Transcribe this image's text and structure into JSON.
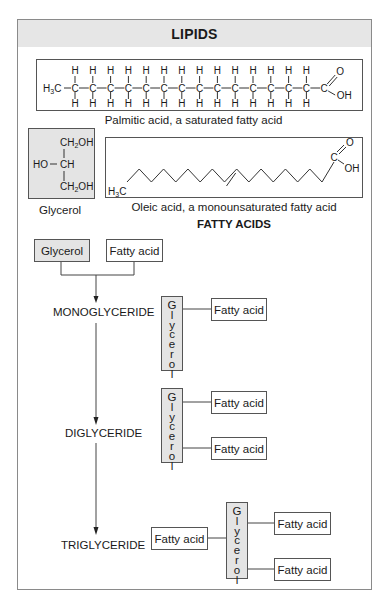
{
  "title": "LIPIDS",
  "fatty_acids_section": {
    "heading": "FATTY ACIDS",
    "palmitic": {
      "caption": "Palmitic acid, a saturated fatty acid",
      "methyl": "H3C",
      "ch2_count": 14,
      "atom_h": "H",
      "atom_c": "C",
      "carboxyl_o": "O",
      "carboxyl_oh": "OH"
    },
    "oleic": {
      "caption": "Oleic acid, a monounsaturated fatty acid",
      "methyl": "H3C",
      "carboxyl_c": "C",
      "carboxyl_o": "O",
      "carboxyl_oh": "OH"
    },
    "glycerol": {
      "caption": "Glycerol",
      "top": "CH2OH",
      "middle_left": "HO",
      "middle": "CH",
      "bottom": "CH2OH"
    }
  },
  "flow": {
    "start": {
      "glycerol": "Glycerol",
      "fatty_acid": "Fatty acid"
    },
    "stages": [
      {
        "label": "MONOGLYCERIDE",
        "fatty_acids": [
          "Fatty acid"
        ]
      },
      {
        "label": "DIGLYCERIDE",
        "fatty_acids": [
          "Fatty acid",
          "Fatty acid"
        ]
      },
      {
        "label": "TRIGLYCERIDE",
        "fatty_acids": [
          "Fatty acid",
          "Fatty acid",
          "Fatty acid"
        ]
      }
    ],
    "glycerol_vertical_letters": [
      "G",
      "l",
      "y",
      "c",
      "e",
      "r",
      "o",
      "l"
    ]
  },
  "colors": {
    "header_bg": "#e6e6e6",
    "box_gray": "#e4e4e4",
    "line": "#555555"
  }
}
